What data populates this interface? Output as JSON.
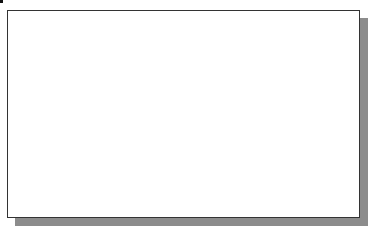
{
  "viewport": {
    "title": "",
    "background": "#ffffff",
    "frame_color": "#333333",
    "shadow_color": "#8c8c8c"
  },
  "grid": {
    "visible": true,
    "spacing_px": 30,
    "color": "#d4d4d4",
    "vertical_lines_x": [
      22,
      52,
      81,
      111,
      141,
      171,
      201,
      231,
      291,
      321,
      350
    ],
    "horizontal_lines_y": [
      31,
      61,
      91,
      121,
      151,
      181,
      211
    ],
    "axis_line": {
      "x": 261,
      "color": "#555555"
    }
  },
  "entities": {
    "circle": {
      "type": "circle",
      "cx": 100,
      "cy": 118,
      "r": 83,
      "stroke": "#3a3a3a"
    },
    "center_point": {
      "x": 100,
      "y": 118
    }
  },
  "cursor": {
    "type": "crosshair",
    "x": 332,
    "y": 52
  }
}
